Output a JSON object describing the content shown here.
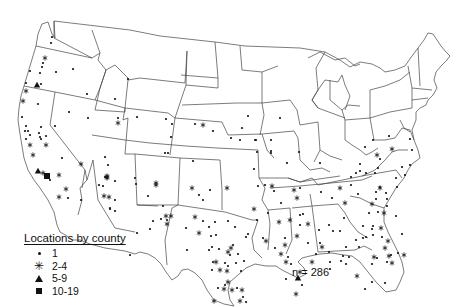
{
  "legend": {
    "title": "Locations by county",
    "items": [
      {
        "symbol": "dot",
        "label": "1"
      },
      {
        "symbol": "asterisk",
        "label": "2-4"
      },
      {
        "symbol": "triangle",
        "label": "5-9"
      },
      {
        "symbol": "square",
        "label": "10-19"
      }
    ]
  },
  "annotation": {
    "count_label": "n = 286"
  },
  "map": {
    "title": "Locations by county",
    "region": "Contiguous United States",
    "stroke_color": "#444444",
    "marker_color": "#111111"
  },
  "points": [
    {
      "x": 52,
      "y": 37,
      "s": "dot"
    },
    {
      "x": 51,
      "y": 43,
      "s": "dot"
    },
    {
      "x": 45,
      "y": 58,
      "s": "asterisk"
    },
    {
      "x": 43,
      "y": 63,
      "s": "dot"
    },
    {
      "x": 42,
      "y": 67,
      "s": "dot"
    },
    {
      "x": 30,
      "y": 71,
      "s": "dot"
    },
    {
      "x": 40,
      "y": 73,
      "s": "dot"
    },
    {
      "x": 56,
      "y": 72,
      "s": "dot"
    },
    {
      "x": 73,
      "y": 69,
      "s": "dot"
    },
    {
      "x": 26,
      "y": 83,
      "s": "dot"
    },
    {
      "x": 37,
      "y": 85,
      "s": "triangle"
    },
    {
      "x": 41,
      "y": 84,
      "s": "dot"
    },
    {
      "x": 26,
      "y": 91,
      "s": "asterisk"
    },
    {
      "x": 23,
      "y": 101,
      "s": "asterisk"
    },
    {
      "x": 38,
      "y": 104,
      "s": "dot"
    },
    {
      "x": 87,
      "y": 94,
      "s": "dot"
    },
    {
      "x": 115,
      "y": 99,
      "s": "dot"
    },
    {
      "x": 128,
      "y": 79,
      "s": "dot"
    },
    {
      "x": 69,
      "y": 112,
      "s": "dot"
    },
    {
      "x": 88,
      "y": 118,
      "s": "dot"
    },
    {
      "x": 118,
      "y": 118,
      "s": "dot"
    },
    {
      "x": 118,
      "y": 123,
      "s": "asterisk"
    },
    {
      "x": 137,
      "y": 117,
      "s": "dot"
    },
    {
      "x": 22,
      "y": 117,
      "s": "dot"
    },
    {
      "x": 26,
      "y": 126,
      "s": "dot"
    },
    {
      "x": 28,
      "y": 131,
      "s": "dot"
    },
    {
      "x": 25,
      "y": 131,
      "s": "dot"
    },
    {
      "x": 30,
      "y": 135,
      "s": "dot"
    },
    {
      "x": 26,
      "y": 139,
      "s": "dot"
    },
    {
      "x": 30,
      "y": 145,
      "s": "asterisk"
    },
    {
      "x": 41,
      "y": 127,
      "s": "dot"
    },
    {
      "x": 39,
      "y": 133,
      "s": "dot"
    },
    {
      "x": 40,
      "y": 137,
      "s": "dot"
    },
    {
      "x": 46,
      "y": 136,
      "s": "dot"
    },
    {
      "x": 41,
      "y": 139,
      "s": "dot"
    },
    {
      "x": 46,
      "y": 145,
      "s": "asterisk"
    },
    {
      "x": 55,
      "y": 126,
      "s": "dot"
    },
    {
      "x": 33,
      "y": 155,
      "s": "asterisk"
    },
    {
      "x": 38,
      "y": 171,
      "s": "triangle"
    },
    {
      "x": 43,
      "y": 173,
      "s": "asterisk"
    },
    {
      "x": 47,
      "y": 176,
      "s": "square"
    },
    {
      "x": 50,
      "y": 180,
      "s": "dot"
    },
    {
      "x": 59,
      "y": 175,
      "s": "asterisk"
    },
    {
      "x": 62,
      "y": 158,
      "s": "dot"
    },
    {
      "x": 66,
      "y": 189,
      "s": "asterisk"
    },
    {
      "x": 59,
      "y": 197,
      "s": "asterisk"
    },
    {
      "x": 68,
      "y": 198,
      "s": "dot"
    },
    {
      "x": 81,
      "y": 200,
      "s": "dot"
    },
    {
      "x": 81,
      "y": 164,
      "s": "asterisk"
    },
    {
      "x": 105,
      "y": 157,
      "s": "dot"
    },
    {
      "x": 108,
      "y": 165,
      "s": "dot"
    },
    {
      "x": 107,
      "y": 176,
      "s": "asterisk"
    },
    {
      "x": 115,
      "y": 181,
      "s": "dot"
    },
    {
      "x": 99,
      "y": 185,
      "s": "dot"
    },
    {
      "x": 104,
      "y": 196,
      "s": "asterisk"
    },
    {
      "x": 110,
      "y": 209,
      "s": "dot"
    },
    {
      "x": 136,
      "y": 184,
      "s": "dot"
    },
    {
      "x": 156,
      "y": 183,
      "s": "asterisk"
    },
    {
      "x": 105,
      "y": 177,
      "s": "dot"
    },
    {
      "x": 107,
      "y": 178,
      "s": "asterisk"
    },
    {
      "x": 115,
      "y": 200,
      "s": "dot"
    },
    {
      "x": 107,
      "y": 177,
      "s": "asterisk"
    },
    {
      "x": 103,
      "y": 186,
      "s": "dot"
    },
    {
      "x": 109,
      "y": 197,
      "s": "asterisk"
    },
    {
      "x": 110,
      "y": 208,
      "s": "dot"
    },
    {
      "x": 115,
      "y": 211,
      "s": "dot"
    },
    {
      "x": 165,
      "y": 153,
      "s": "dot"
    },
    {
      "x": 135,
      "y": 178,
      "s": "dot"
    },
    {
      "x": 156,
      "y": 185,
      "s": "asterisk"
    },
    {
      "x": 171,
      "y": 216,
      "s": "asterisk"
    },
    {
      "x": 167,
      "y": 224,
      "s": "asterisk"
    },
    {
      "x": 153,
      "y": 221,
      "s": "dot"
    },
    {
      "x": 148,
      "y": 196,
      "s": "dot"
    },
    {
      "x": 192,
      "y": 188,
      "s": "asterisk"
    },
    {
      "x": 193,
      "y": 161,
      "s": "dot"
    },
    {
      "x": 227,
      "y": 188,
      "s": "asterisk"
    },
    {
      "x": 228,
      "y": 221,
      "s": "dot"
    },
    {
      "x": 235,
      "y": 227,
      "s": "dot"
    },
    {
      "x": 248,
      "y": 234,
      "s": "dot"
    },
    {
      "x": 254,
      "y": 209,
      "s": "asterisk"
    },
    {
      "x": 258,
      "y": 186,
      "s": "dot"
    },
    {
      "x": 257,
      "y": 220,
      "s": "dot"
    },
    {
      "x": 268,
      "y": 213,
      "s": "dot"
    },
    {
      "x": 272,
      "y": 186,
      "s": "asterisk"
    },
    {
      "x": 274,
      "y": 191,
      "s": "dot"
    },
    {
      "x": 281,
      "y": 203,
      "s": "dot"
    },
    {
      "x": 294,
      "y": 190,
      "s": "asterisk"
    },
    {
      "x": 297,
      "y": 198,
      "s": "asterisk"
    },
    {
      "x": 300,
      "y": 215,
      "s": "dot"
    },
    {
      "x": 279,
      "y": 222,
      "s": "asterisk"
    },
    {
      "x": 285,
      "y": 238,
      "s": "dot"
    },
    {
      "x": 297,
      "y": 236,
      "s": "asterisk"
    },
    {
      "x": 281,
      "y": 254,
      "s": "asterisk"
    },
    {
      "x": 288,
      "y": 257,
      "s": "dot"
    },
    {
      "x": 285,
      "y": 245,
      "s": "asterisk"
    },
    {
      "x": 286,
      "y": 262,
      "s": "asterisk"
    },
    {
      "x": 291,
      "y": 264,
      "s": "dot"
    },
    {
      "x": 275,
      "y": 248,
      "s": "dot"
    },
    {
      "x": 263,
      "y": 238,
      "s": "dot"
    },
    {
      "x": 266,
      "y": 241,
      "s": "asterisk"
    },
    {
      "x": 233,
      "y": 245,
      "s": "dot"
    },
    {
      "x": 225,
      "y": 263,
      "s": "dot"
    },
    {
      "x": 228,
      "y": 252,
      "s": "asterisk"
    },
    {
      "x": 238,
      "y": 254,
      "s": "dot"
    },
    {
      "x": 231,
      "y": 248,
      "s": "asterisk"
    },
    {
      "x": 210,
      "y": 190,
      "s": "dot"
    },
    {
      "x": 199,
      "y": 195,
      "s": "dot"
    },
    {
      "x": 203,
      "y": 200,
      "s": "dot"
    },
    {
      "x": 213,
      "y": 262,
      "s": "dot"
    },
    {
      "x": 220,
      "y": 270,
      "s": "asterisk"
    },
    {
      "x": 166,
      "y": 119,
      "s": "dot"
    },
    {
      "x": 172,
      "y": 124,
      "s": "dot"
    },
    {
      "x": 195,
      "y": 124,
      "s": "dot"
    },
    {
      "x": 203,
      "y": 125,
      "s": "asterisk"
    },
    {
      "x": 213,
      "y": 131,
      "s": "dot"
    },
    {
      "x": 171,
      "y": 137,
      "s": "dot"
    },
    {
      "x": 168,
      "y": 153,
      "s": "dot"
    },
    {
      "x": 248,
      "y": 116,
      "s": "dot"
    },
    {
      "x": 280,
      "y": 118,
      "s": "dot"
    },
    {
      "x": 256,
      "y": 140,
      "s": "dot"
    },
    {
      "x": 271,
      "y": 153,
      "s": "dot"
    },
    {
      "x": 240,
      "y": 140,
      "s": "dot"
    },
    {
      "x": 242,
      "y": 128,
      "s": "dot"
    },
    {
      "x": 231,
      "y": 138,
      "s": "dot"
    },
    {
      "x": 255,
      "y": 140,
      "s": "dot"
    },
    {
      "x": 271,
      "y": 151,
      "s": "dot"
    },
    {
      "x": 271,
      "y": 140,
      "s": "dot"
    },
    {
      "x": 257,
      "y": 152,
      "s": "dot"
    },
    {
      "x": 254,
      "y": 169,
      "s": "dot"
    },
    {
      "x": 265,
      "y": 185,
      "s": "dot"
    },
    {
      "x": 287,
      "y": 163,
      "s": "dot"
    },
    {
      "x": 299,
      "y": 152,
      "s": "dot"
    },
    {
      "x": 300,
      "y": 188,
      "s": "dot"
    },
    {
      "x": 320,
      "y": 163,
      "s": "dot"
    },
    {
      "x": 321,
      "y": 192,
      "s": "dot"
    },
    {
      "x": 332,
      "y": 198,
      "s": "dot"
    },
    {
      "x": 340,
      "y": 188,
      "s": "asterisk"
    },
    {
      "x": 345,
      "y": 203,
      "s": "asterisk"
    },
    {
      "x": 344,
      "y": 218,
      "s": "dot"
    },
    {
      "x": 329,
      "y": 225,
      "s": "dot"
    },
    {
      "x": 303,
      "y": 214,
      "s": "dot"
    },
    {
      "x": 308,
      "y": 224,
      "s": "asterisk"
    },
    {
      "x": 290,
      "y": 220,
      "s": "asterisk"
    },
    {
      "x": 300,
      "y": 225,
      "s": "dot"
    },
    {
      "x": 308,
      "y": 243,
      "s": "dot"
    },
    {
      "x": 316,
      "y": 254,
      "s": "dot"
    },
    {
      "x": 319,
      "y": 230,
      "s": "dot"
    },
    {
      "x": 322,
      "y": 247,
      "s": "asterisk"
    },
    {
      "x": 329,
      "y": 252,
      "s": "dot"
    },
    {
      "x": 320,
      "y": 243,
      "s": "dot"
    },
    {
      "x": 333,
      "y": 231,
      "s": "dot"
    },
    {
      "x": 340,
      "y": 231,
      "s": "dot"
    },
    {
      "x": 346,
      "y": 247,
      "s": "dot"
    },
    {
      "x": 356,
      "y": 240,
      "s": "dot"
    },
    {
      "x": 366,
      "y": 237,
      "s": "dot"
    },
    {
      "x": 363,
      "y": 226,
      "s": "dot"
    },
    {
      "x": 369,
      "y": 213,
      "s": "dot"
    },
    {
      "x": 372,
      "y": 204,
      "s": "asterisk"
    },
    {
      "x": 376,
      "y": 199,
      "s": "dot"
    },
    {
      "x": 376,
      "y": 192,
      "s": "dot"
    },
    {
      "x": 380,
      "y": 188,
      "s": "asterisk"
    },
    {
      "x": 358,
      "y": 194,
      "s": "dot"
    },
    {
      "x": 351,
      "y": 185,
      "s": "dot"
    },
    {
      "x": 351,
      "y": 177,
      "s": "dot"
    },
    {
      "x": 360,
      "y": 164,
      "s": "dot"
    },
    {
      "x": 360,
      "y": 171,
      "s": "dot"
    },
    {
      "x": 356,
      "y": 173,
      "s": "dot"
    },
    {
      "x": 366,
      "y": 173,
      "s": "dot"
    },
    {
      "x": 375,
      "y": 173,
      "s": "dot"
    },
    {
      "x": 378,
      "y": 168,
      "s": "dot"
    },
    {
      "x": 377,
      "y": 155,
      "s": "asterisk"
    },
    {
      "x": 365,
      "y": 147,
      "s": "dot"
    },
    {
      "x": 373,
      "y": 140,
      "s": "dot"
    },
    {
      "x": 389,
      "y": 136,
      "s": "dot"
    },
    {
      "x": 392,
      "y": 149,
      "s": "asterisk"
    },
    {
      "x": 396,
      "y": 178,
      "s": "dot"
    },
    {
      "x": 397,
      "y": 187,
      "s": "dot"
    },
    {
      "x": 402,
      "y": 167,
      "s": "dot"
    },
    {
      "x": 410,
      "y": 165,
      "s": "dot"
    },
    {
      "x": 380,
      "y": 159,
      "s": "dot"
    },
    {
      "x": 410,
      "y": 139,
      "s": "dot"
    },
    {
      "x": 412,
      "y": 150,
      "s": "dot"
    },
    {
      "x": 405,
      "y": 175,
      "s": "dot"
    },
    {
      "x": 380,
      "y": 187,
      "s": "dot"
    },
    {
      "x": 386,
      "y": 193,
      "s": "dot"
    },
    {
      "x": 387,
      "y": 199,
      "s": "dot"
    },
    {
      "x": 387,
      "y": 206,
      "s": "dot"
    },
    {
      "x": 378,
      "y": 212,
      "s": "dot"
    },
    {
      "x": 396,
      "y": 216,
      "s": "dot"
    },
    {
      "x": 372,
      "y": 229,
      "s": "dot"
    },
    {
      "x": 363,
      "y": 238,
      "s": "dot"
    },
    {
      "x": 384,
      "y": 213,
      "s": "asterisk"
    },
    {
      "x": 373,
      "y": 226,
      "s": "dot"
    },
    {
      "x": 381,
      "y": 228,
      "s": "asterisk"
    },
    {
      "x": 382,
      "y": 237,
      "s": "dot"
    },
    {
      "x": 388,
      "y": 241,
      "s": "asterisk"
    },
    {
      "x": 385,
      "y": 248,
      "s": "asterisk"
    },
    {
      "x": 391,
      "y": 255,
      "s": "dot"
    },
    {
      "x": 402,
      "y": 234,
      "s": "dot"
    },
    {
      "x": 387,
      "y": 262,
      "s": "dot"
    },
    {
      "x": 404,
      "y": 255,
      "s": "asterisk"
    },
    {
      "x": 392,
      "y": 263,
      "s": "asterisk"
    },
    {
      "x": 373,
      "y": 235,
      "s": "dot"
    },
    {
      "x": 343,
      "y": 256,
      "s": "dot"
    },
    {
      "x": 359,
      "y": 247,
      "s": "dot"
    },
    {
      "x": 374,
      "y": 257,
      "s": "asterisk"
    },
    {
      "x": 377,
      "y": 258,
      "s": "dot"
    },
    {
      "x": 372,
      "y": 264,
      "s": "dot"
    },
    {
      "x": 389,
      "y": 256,
      "s": "asterisk"
    },
    {
      "x": 398,
      "y": 253,
      "s": "dot"
    },
    {
      "x": 330,
      "y": 269,
      "s": "dot"
    },
    {
      "x": 341,
      "y": 261,
      "s": "dot"
    },
    {
      "x": 385,
      "y": 283,
      "s": "dot"
    },
    {
      "x": 372,
      "y": 282,
      "s": "dot"
    },
    {
      "x": 357,
      "y": 276,
      "s": "asterisk"
    },
    {
      "x": 365,
      "y": 289,
      "s": "dot"
    },
    {
      "x": 312,
      "y": 262,
      "s": "asterisk"
    },
    {
      "x": 330,
      "y": 262,
      "s": "dot"
    },
    {
      "x": 346,
      "y": 264,
      "s": "dot"
    },
    {
      "x": 300,
      "y": 272,
      "s": "asterisk"
    },
    {
      "x": 298,
      "y": 278,
      "s": "triangle"
    },
    {
      "x": 302,
      "y": 285,
      "s": "dot"
    },
    {
      "x": 286,
      "y": 279,
      "s": "dot"
    },
    {
      "x": 296,
      "y": 294,
      "s": "asterisk"
    },
    {
      "x": 349,
      "y": 257,
      "s": "dot"
    },
    {
      "x": 236,
      "y": 263,
      "s": "dot"
    },
    {
      "x": 246,
      "y": 237,
      "s": "dot"
    },
    {
      "x": 244,
      "y": 261,
      "s": "dot"
    },
    {
      "x": 241,
      "y": 271,
      "s": "dot"
    },
    {
      "x": 228,
      "y": 282,
      "s": "asterisk"
    },
    {
      "x": 242,
      "y": 290,
      "s": "asterisk"
    },
    {
      "x": 243,
      "y": 297,
      "s": "dot"
    },
    {
      "x": 240,
      "y": 301,
      "s": "asterisk"
    },
    {
      "x": 246,
      "y": 302,
      "s": "dot"
    },
    {
      "x": 212,
      "y": 247,
      "s": "dot"
    },
    {
      "x": 225,
      "y": 285,
      "s": "dot"
    },
    {
      "x": 211,
      "y": 236,
      "s": "dot"
    },
    {
      "x": 137,
      "y": 233,
      "s": "dot"
    },
    {
      "x": 166,
      "y": 216,
      "s": "asterisk"
    },
    {
      "x": 130,
      "y": 255,
      "s": "dot"
    },
    {
      "x": 150,
      "y": 229,
      "s": "dot"
    },
    {
      "x": 167,
      "y": 220,
      "s": "dot"
    },
    {
      "x": 195,
      "y": 217,
      "s": "asterisk"
    },
    {
      "x": 203,
      "y": 221,
      "s": "dot"
    },
    {
      "x": 209,
      "y": 227,
      "s": "dot"
    },
    {
      "x": 186,
      "y": 228,
      "s": "dot"
    },
    {
      "x": 187,
      "y": 250,
      "s": "dot"
    },
    {
      "x": 199,
      "y": 233,
      "s": "asterisk"
    },
    {
      "x": 216,
      "y": 235,
      "s": "dot"
    },
    {
      "x": 215,
      "y": 222,
      "s": "dot"
    },
    {
      "x": 219,
      "y": 249,
      "s": "dot"
    },
    {
      "x": 230,
      "y": 255,
      "s": "dot"
    },
    {
      "x": 228,
      "y": 266,
      "s": "dot"
    },
    {
      "x": 227,
      "y": 271,
      "s": "asterisk"
    },
    {
      "x": 224,
      "y": 289,
      "s": "asterisk"
    },
    {
      "x": 214,
      "y": 301,
      "s": "asterisk"
    },
    {
      "x": 218,
      "y": 288,
      "s": "dot"
    },
    {
      "x": 212,
      "y": 270,
      "s": "dot"
    },
    {
      "x": 209,
      "y": 250,
      "s": "dot"
    },
    {
      "x": 232,
      "y": 290,
      "s": "asterisk"
    },
    {
      "x": 237,
      "y": 288,
      "s": "dot"
    },
    {
      "x": 216,
      "y": 262,
      "s": "asterisk"
    },
    {
      "x": 163,
      "y": 206,
      "s": "dot"
    },
    {
      "x": 161,
      "y": 219,
      "s": "dot"
    }
  ]
}
